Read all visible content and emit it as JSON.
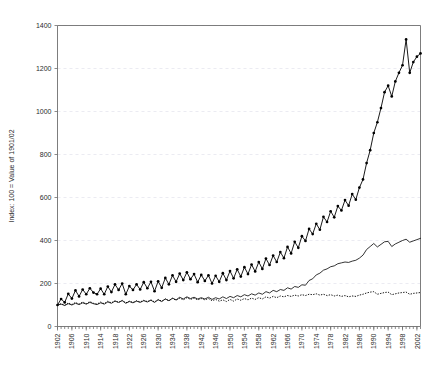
{
  "chart_data": {
    "type": "line",
    "title": "",
    "xlabel": "",
    "ylabel": "Index: 100 = Value of 1901/02",
    "xlim": [
      1902,
      2003
    ],
    "ylim": [
      0,
      1400
    ],
    "grid": true,
    "legend": "none",
    "ytick_labels": [
      "0",
      "200",
      "400",
      "600",
      "800",
      "1000",
      "1200",
      "1400"
    ],
    "ytick_values": [
      0,
      200,
      400,
      600,
      800,
      1000,
      1200,
      1400
    ],
    "xtick_labels": [
      "1902",
      "1906",
      "1910",
      "1914",
      "1918",
      "1922",
      "1926",
      "1930",
      "1934",
      "1938",
      "1942",
      "1946",
      "1950",
      "1954",
      "1958",
      "1962",
      "1966",
      "1970",
      "1974",
      "1978",
      "1982",
      "1986",
      "1990",
      "1994",
      "1998",
      "2002"
    ],
    "xtick_values": [
      1902,
      1906,
      1910,
      1914,
      1918,
      1922,
      1926,
      1930,
      1934,
      1938,
      1942,
      1946,
      1950,
      1954,
      1958,
      1962,
      1966,
      1970,
      1974,
      1978,
      1982,
      1986,
      1990,
      1994,
      1998,
      2002
    ],
    "x": [
      1902,
      1903,
      1904,
      1905,
      1906,
      1907,
      1908,
      1909,
      1910,
      1911,
      1912,
      1913,
      1914,
      1915,
      1916,
      1917,
      1918,
      1919,
      1920,
      1921,
      1922,
      1923,
      1924,
      1925,
      1926,
      1927,
      1928,
      1929,
      1930,
      1931,
      1932,
      1933,
      1934,
      1935,
      1936,
      1937,
      1938,
      1939,
      1940,
      1941,
      1942,
      1943,
      1944,
      1945,
      1946,
      1947,
      1948,
      1949,
      1950,
      1951,
      1952,
      1953,
      1954,
      1955,
      1956,
      1957,
      1958,
      1959,
      1960,
      1961,
      1962,
      1963,
      1964,
      1965,
      1966,
      1967,
      1968,
      1969,
      1970,
      1971,
      1972,
      1973,
      1974,
      1975,
      1976,
      1977,
      1978,
      1979,
      1980,
      1981,
      1982,
      1983,
      1984,
      1985,
      1986,
      1987,
      1988,
      1989,
      1990,
      1991,
      1992,
      1993,
      1994,
      1995,
      1996,
      1997,
      1998,
      1999,
      2000,
      2001,
      2002,
      2003
    ],
    "series": [
      {
        "name": "marked-series",
        "style": "line-with-diamond-markers",
        "values": [
          100,
          128,
          112,
          152,
          130,
          168,
          140,
          172,
          150,
          178,
          158,
          150,
          176,
          150,
          186,
          160,
          196,
          170,
          200,
          150,
          188,
          170,
          196,
          172,
          206,
          178,
          208,
          164,
          210,
          180,
          226,
          196,
          238,
          208,
          246,
          216,
          252,
          220,
          244,
          206,
          240,
          212,
          238,
          200,
          236,
          208,
          248,
          216,
          258,
          224,
          266,
          232,
          276,
          244,
          288,
          256,
          300,
          268,
          316,
          286,
          330,
          300,
          346,
          318,
          370,
          340,
          394,
          366,
          420,
          398,
          454,
          430,
          478,
          450,
          510,
          486,
          536,
          508,
          560,
          540,
          588,
          562,
          616,
          590,
          646,
          684,
          760,
          820,
          900,
          950,
          1016,
          1090,
          1120,
          1070,
          1140,
          1180,
          1215,
          1335,
          1180,
          1230,
          1255,
          1270
        ],
        "marker": "diamond"
      },
      {
        "name": "plain-line-series",
        "style": "solid-line",
        "values": [
          100,
          104,
          98,
          106,
          100,
          108,
          102,
          110,
          104,
          112,
          106,
          102,
          110,
          104,
          114,
          108,
          118,
          112,
          120,
          108,
          116,
          110,
          118,
          112,
          120,
          114,
          122,
          112,
          124,
          116,
          128,
          120,
          132,
          124,
          136,
          128,
          138,
          130,
          136,
          128,
          134,
          128,
          136,
          126,
          134,
          128,
          138,
          130,
          140,
          134,
          144,
          138,
          148,
          142,
          152,
          146,
          156,
          150,
          162,
          156,
          168,
          162,
          172,
          168,
          180,
          174,
          186,
          182,
          194,
          192,
          214,
          222,
          240,
          248,
          262,
          268,
          278,
          282,
          292,
          296,
          300,
          298,
          304,
          308,
          318,
          332,
          358,
          372,
          386,
          370,
          382,
          394,
          396,
          372,
          384,
          392,
          400,
          406,
          392,
          398,
          404,
          410
        ],
        "marker": "none"
      },
      {
        "name": "dotted-series",
        "style": "dotted-line",
        "values": [
          100,
          106,
          98,
          110,
          102,
          112,
          104,
          114,
          106,
          116,
          108,
          104,
          114,
          106,
          118,
          110,
          120,
          112,
          122,
          110,
          118,
          112,
          120,
          114,
          122,
          116,
          124,
          114,
          126,
          118,
          128,
          120,
          130,
          122,
          132,
          124,
          134,
          126,
          132,
          124,
          130,
          124,
          130,
          120,
          126,
          118,
          124,
          116,
          126,
          118,
          128,
          122,
          130,
          124,
          132,
          126,
          134,
          128,
          138,
          132,
          140,
          134,
          142,
          138,
          144,
          140,
          146,
          142,
          148,
          144,
          150,
          148,
          152,
          146,
          150,
          144,
          148,
          142,
          146,
          140,
          144,
          138,
          142,
          140,
          146,
          150,
          156,
          160,
          162,
          150,
          154,
          158,
          160,
          148,
          152,
          156,
          158,
          160,
          150,
          154,
          156,
          158
        ],
        "marker": "none"
      }
    ]
  }
}
